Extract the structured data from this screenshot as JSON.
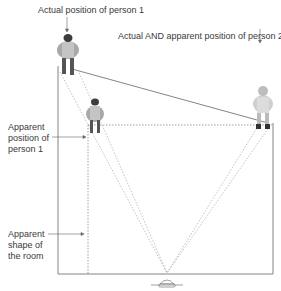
{
  "diagram": {
    "labels": {
      "actual_person1": "Actual position of person 1",
      "actual_apparent_person2": "Actual AND apparent position of person 2",
      "apparent_person1": "Apparent\nposition of\nperson 1",
      "apparent_room": "Apparent\nshape of\nthe room"
    },
    "elements": {
      "person1_actual": "person 1 (actual, far corner)",
      "person1_apparent": "person 1 (apparent)",
      "person2": "person 2",
      "camera": "viewer / camera"
    },
    "colors": {
      "line": "#555555",
      "dotted": "#888888",
      "figure": "#9a9a9a",
      "figure_dark": "#4a4a4a"
    }
  }
}
